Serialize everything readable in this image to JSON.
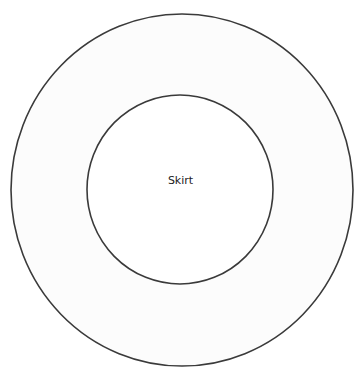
{
  "diagram": {
    "title": "",
    "center_label": "Skirt",
    "shapes": [
      {
        "name": "outer-circle",
        "type": "ellipse",
        "cx": 182,
        "cy": 190,
        "rx": 171,
        "ry": 176
      },
      {
        "name": "inner-circle",
        "type": "ellipse",
        "cx": 180,
        "cy": 189.5,
        "rx": 93,
        "ry": 94.5
      }
    ],
    "colors": {
      "stroke": "#3a3a3a",
      "fill": "#fdfdfd",
      "background": "#ffffff"
    }
  }
}
